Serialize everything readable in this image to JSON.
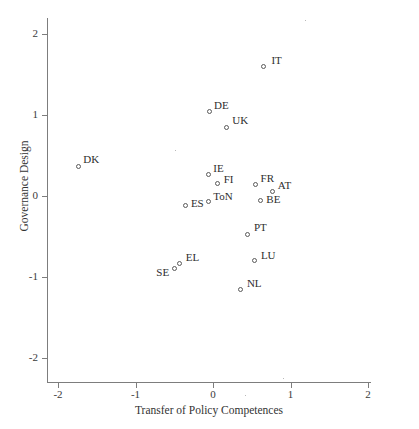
{
  "chart_data": {
    "type": "scatter",
    "title": "",
    "xlabel": "Transfer of Policy Competences",
    "ylabel": "Governance Design",
    "xlim": [
      -2.25,
      2.25
    ],
    "ylim": [
      -2.25,
      2.25
    ],
    "xticks": [
      "-2",
      "-1",
      "0",
      "1",
      "2"
    ],
    "xtick_values": [
      -2,
      -1,
      0,
      1,
      2
    ],
    "yticks": [
      "2",
      "1",
      "0",
      "-1",
      "-2"
    ],
    "ytick_values": [
      2,
      1,
      0,
      -1,
      -2
    ],
    "grid": false,
    "legend": false,
    "marker": "open-circle",
    "points": [
      {
        "label": "IT",
        "x": 0.65,
        "y": 1.6,
        "lx": 8,
        "ly": -12
      },
      {
        "label": "DE",
        "x": -0.05,
        "y": 1.04,
        "lx": 5,
        "ly": -13
      },
      {
        "label": "UK",
        "x": 0.17,
        "y": 0.85,
        "lx": 6,
        "ly": -13
      },
      {
        "label": "DK",
        "x": -1.74,
        "y": 0.37,
        "lx": 5,
        "ly": -13
      },
      {
        "label": "IE",
        "x": -0.06,
        "y": 0.26,
        "lx": 5,
        "ly": -13
      },
      {
        "label": "FI",
        "x": 0.06,
        "y": 0.15,
        "lx": 6,
        "ly": -11
      },
      {
        "label": "FR",
        "x": 0.55,
        "y": 0.14,
        "lx": 5,
        "ly": -13
      },
      {
        "label": "AT",
        "x": 0.77,
        "y": 0.06,
        "lx": 5,
        "ly": -12
      },
      {
        "label": "ToN",
        "x": -0.06,
        "y": -0.07,
        "lx": 5,
        "ly": -12
      },
      {
        "label": "BE",
        "x": 0.61,
        "y": -0.06,
        "lx": 6,
        "ly": -8
      },
      {
        "label": "ES",
        "x": -0.35,
        "y": -0.12,
        "lx": 5,
        "ly": -9
      },
      {
        "label": "PT",
        "x": 0.45,
        "y": -0.47,
        "lx": 6,
        "ly": -13
      },
      {
        "label": "LU",
        "x": 0.54,
        "y": -0.8,
        "lx": 6,
        "ly": -12
      },
      {
        "label": "EL",
        "x": -0.43,
        "y": -0.83,
        "lx": 6,
        "ly": -12
      },
      {
        "label": "SE",
        "x": -0.5,
        "y": -0.89,
        "lx": -18,
        "ly": -2
      },
      {
        "label": "NL",
        "x": 0.36,
        "y": -1.15,
        "lx": 6,
        "ly": -12
      }
    ]
  }
}
